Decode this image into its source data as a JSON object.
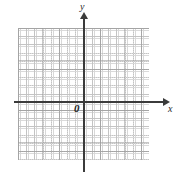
{
  "figure": {
    "type": "coordinate-plane",
    "width": 177,
    "height": 181,
    "background_color": "#ffffff"
  },
  "axes": {
    "x_label": "x",
    "y_label": "y",
    "origin_label": "0",
    "axis_color": "#3b3b3b",
    "x_arrow_direction": "right",
    "y_arrow_direction": "up"
  },
  "grid": {
    "minor_color": "#b9b9b9",
    "major_color": "#9a9a9a",
    "style": "dotted",
    "minor_spacing_px": 8.2,
    "major_every_n_minor": 5,
    "columns": 16,
    "rows": 16
  },
  "chart_data": {
    "type": "scatter",
    "title": "",
    "xlabel": "x",
    "ylabel": "y",
    "origin_label": "0",
    "xlim": [
      -8,
      8
    ],
    "ylim": [
      -8,
      8
    ],
    "xticks": [],
    "yticks": [],
    "grid": true,
    "legend": null,
    "series": [
      {
        "name": "",
        "x": [],
        "y": []
      }
    ],
    "annotations": []
  }
}
